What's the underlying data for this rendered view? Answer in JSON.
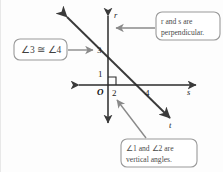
{
  "figure": {
    "background_color": "#fdfdfd",
    "line_color": "#3a3a3a",
    "callout_color": "#8a8a8a",
    "text_color": "#4a4a4a"
  },
  "axes": {
    "vertical_label": "r",
    "horizontal_label": "s",
    "transversal_label": "t",
    "origin_label": "O"
  },
  "tick_labels": {
    "one": "1",
    "two": "2",
    "three": "3",
    "four": "4"
  },
  "callouts": {
    "left": {
      "text": "∠3 ≅ ∠4",
      "pointer": "arrow-right"
    },
    "top_right": {
      "line1": "r and s are",
      "line2": "perpendicular.",
      "pointer": "arrow-left"
    },
    "bottom": {
      "line1": "∠1 and ∠2 are",
      "line2": "vertical angles.",
      "pointer": "arrow-up-left"
    }
  },
  "markers": {
    "right_angle": "right-angle-square"
  }
}
